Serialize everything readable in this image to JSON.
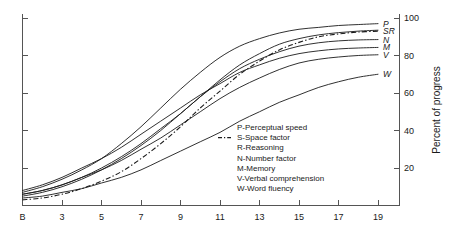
{
  "chart_data": {
    "type": "line",
    "title": "",
    "subtitle": "",
    "xlabel": "",
    "ylabel": "Percent of progress",
    "xlim": [
      0,
      20
    ],
    "ylim": [
      0,
      105
    ],
    "grid": false,
    "legend_position": "center-right-inside",
    "x_tick_labels": [
      "B",
      "3",
      "5",
      "7",
      "9",
      "11",
      "13",
      "15",
      "17",
      "19"
    ],
    "x_tick_values": [
      1,
      3,
      5,
      7,
      9,
      11,
      13,
      15,
      17,
      19
    ],
    "y_tick_labels": [
      "20",
      "40",
      "60",
      "80",
      "100"
    ],
    "y_tick_values": [
      20,
      40,
      60,
      80,
      100
    ],
    "x": [
      1,
      2,
      3,
      4,
      5,
      6,
      7,
      8,
      9,
      10,
      11,
      12,
      13,
      14,
      15,
      16,
      17,
      18,
      19
    ],
    "series": [
      {
        "name": "P",
        "label": "P-Perceptual speed",
        "style": "solid",
        "values": [
          7,
          10,
          14,
          19,
          25,
          33,
          42,
          52,
          62,
          71,
          79,
          85,
          89,
          92,
          94,
          95,
          96,
          96.5,
          97
        ]
      },
      {
        "name": "S",
        "label": "S-Space factor",
        "style": "dashed",
        "values": [
          3,
          4,
          6,
          9,
          13,
          18,
          25,
          33,
          42,
          52,
          61,
          70,
          77,
          83,
          87,
          90,
          91.5,
          92.5,
          93
        ]
      },
      {
        "name": "R",
        "label": "R-Reasoning",
        "style": "solid",
        "values": [
          5,
          7,
          10,
          14,
          19,
          25,
          32,
          40,
          49,
          58,
          67,
          75,
          81,
          86,
          89,
          91,
          92.2,
          93,
          93.5
        ]
      },
      {
        "name": "N",
        "label": "N-Number factor",
        "style": "solid",
        "values": [
          6,
          8,
          11,
          15,
          20,
          26,
          33,
          41,
          49,
          58,
          66,
          73,
          78,
          82,
          85,
          86.8,
          87.8,
          88.3,
          88.5
        ]
      },
      {
        "name": "M",
        "label": "M-Memory",
        "style": "solid",
        "values": [
          8,
          11,
          15,
          20,
          25,
          31,
          38,
          45,
          52,
          59,
          65,
          71,
          75,
          78.5,
          81,
          82.5,
          83.5,
          84,
          84.3
        ]
      },
      {
        "name": "V",
        "label": "V-Verbal comprehension",
        "style": "solid",
        "values": [
          6,
          8,
          11,
          15,
          19,
          24,
          30,
          36,
          43,
          50,
          57,
          63,
          68,
          72.5,
          76,
          78,
          79.2,
          80,
          80.4
        ]
      },
      {
        "name": "W",
        "label": "W-Word fluency",
        "style": "solid",
        "values": [
          4,
          5,
          7,
          9,
          12,
          15,
          19,
          24,
          29,
          34,
          39,
          45,
          50,
          55,
          59,
          63,
          66,
          68.4,
          70
        ]
      }
    ],
    "curve_end_labels": [
      {
        "name": "P",
        "y": 97
      },
      {
        "name": "SR",
        "y": 93.3
      },
      {
        "name": "N",
        "y": 88.5
      },
      {
        "name": "M",
        "y": 84.3
      },
      {
        "name": "V",
        "y": 80.4
      },
      {
        "name": "W",
        "y": 70
      }
    ],
    "legend_entries": [
      {
        "key": "P",
        "text": "P-Perceptual speed",
        "marker": "none"
      },
      {
        "key": "S",
        "text": "S-Space factor",
        "marker": "dashed"
      },
      {
        "key": "R",
        "text": "R-Reasoning",
        "marker": "none"
      },
      {
        "key": "N",
        "text": "N-Number factor",
        "marker": "none"
      },
      {
        "key": "M",
        "text": "M-Memory",
        "marker": "none"
      },
      {
        "key": "V",
        "text": "V-Verbal comprehension",
        "marker": "none"
      },
      {
        "key": "W",
        "text": "W-Word fluency",
        "marker": "none"
      }
    ]
  },
  "colors": {
    "background": "#ffffff",
    "curve": "#1a1a1a",
    "axis": "#555555",
    "text": "#1a1a1a"
  }
}
